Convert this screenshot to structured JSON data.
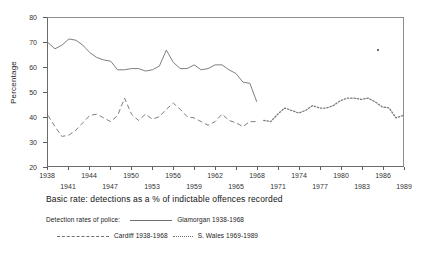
{
  "chart_data": {
    "type": "line",
    "title": "Basic rate: detections as a % of indictable offences recorded",
    "xlabel": "",
    "ylabel": "Percentage",
    "ylim": [
      20,
      80
    ],
    "xlim": [
      1938,
      1989
    ],
    "yticks": [
      20,
      30,
      40,
      50,
      60,
      70,
      80
    ],
    "xticks_row_top": [
      1938,
      1944,
      1950,
      1956,
      1962,
      1968,
      1974,
      1980,
      1986
    ],
    "xticks_row_bottom": [
      1941,
      1947,
      1953,
      1959,
      1965,
      1971,
      1977,
      1983,
      1989
    ],
    "grid": false,
    "legend_position": "below",
    "legend_intro": "Detection rates of police:",
    "series": [
      {
        "name": "Glamorgan 1938-1968",
        "style": "solid",
        "color": "#6f6f6f",
        "x": [
          1938,
          1939,
          1940,
          1941,
          1942,
          1943,
          1944,
          1945,
          1946,
          1947,
          1948,
          1949,
          1950,
          1951,
          1952,
          1953,
          1954,
          1955,
          1956,
          1957,
          1958,
          1959,
          1960,
          1961,
          1962,
          1963,
          1964,
          1965,
          1966,
          1967,
          1968
        ],
        "values": [
          70,
          67.5,
          69,
          71.5,
          71,
          69,
          66,
          64,
          63,
          62.5,
          59,
          59,
          59.5,
          59.5,
          58.5,
          59,
          60.5,
          67,
          62,
          59.5,
          59.5,
          61,
          59,
          59.5,
          61,
          61,
          59,
          57.5,
          54,
          53.5,
          46
        ]
      },
      {
        "name": "Cardiff 1938-1968",
        "style": "dashed",
        "color": "#6f6f6f",
        "x": [
          1938,
          1939,
          1940,
          1941,
          1942,
          1943,
          1944,
          1945,
          1946,
          1947,
          1948,
          1949,
          1950,
          1951,
          1952,
          1953,
          1954,
          1955,
          1956,
          1957,
          1958,
          1959,
          1960,
          1961,
          1962,
          1963,
          1964,
          1965,
          1966,
          1967,
          1968
        ],
        "values": [
          40.5,
          36,
          32,
          32.5,
          34.5,
          37.5,
          40.5,
          41,
          39.5,
          38,
          40.5,
          47.5,
          41,
          38.5,
          41,
          39,
          40,
          43,
          45.5,
          43,
          40,
          39.5,
          38,
          36.5,
          38,
          41,
          38.5,
          37.5,
          36,
          38,
          38
        ]
      },
      {
        "name": "S. Wales 1969-1989",
        "style": "dotted",
        "color": "#7a7a7a",
        "x": [
          1969,
          1970,
          1971,
          1972,
          1973,
          1974,
          1975,
          1976,
          1977,
          1978,
          1979,
          1980,
          1981,
          1982,
          1983,
          1984,
          1985,
          1986,
          1987,
          1988,
          1989
        ],
        "values": [
          38.5,
          38,
          41,
          43.5,
          42.5,
          41.5,
          42.5,
          44.5,
          43.5,
          43.5,
          44.5,
          46.5,
          47.5,
          47.5,
          47,
          47.5,
          46,
          44,
          43.5,
          39.5,
          40.5
        ]
      }
    ]
  },
  "legend": {
    "intro": "Detection rates of police:",
    "entries": [
      {
        "label": "Glamorgan 1938-1968",
        "style": "solid"
      },
      {
        "label": "Cardiff 1938-1968",
        "style": "dashed"
      },
      {
        "label": "S. Wales 1969-1989",
        "style": "dotted"
      }
    ]
  },
  "axes": {
    "y_title": "Percentage"
  }
}
